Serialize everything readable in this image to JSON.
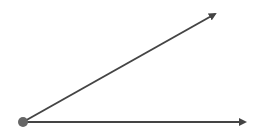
{
  "diagram": {
    "type": "angle",
    "background": "#ffffff",
    "vertex": {
      "x": 23,
      "y": 122,
      "r": 5,
      "color": "#666666"
    },
    "rays": [
      {
        "name": "upper-ray",
        "x1": 23,
        "y1": 122,
        "x2": 215,
        "y2": 14,
        "color": "#444444",
        "width": 2
      },
      {
        "name": "horizontal-ray",
        "x1": 23,
        "y1": 122,
        "x2": 245,
        "y2": 122,
        "color": "#444444",
        "width": 2
      }
    ]
  }
}
